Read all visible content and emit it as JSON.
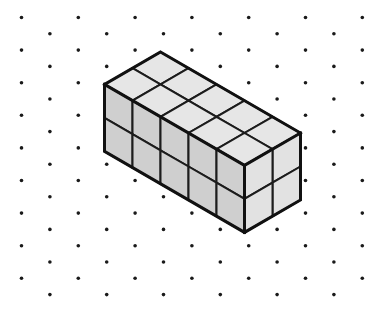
{
  "figure": {
    "type": "isometric-solid-on-dot-grid",
    "canvas": {
      "width": 373,
      "height": 313,
      "background": "#ffffff"
    }
  },
  "dot_grid": {
    "name": "isometric-dot-lattice",
    "pattern": "triangular",
    "dot_color": "#1a1a1a",
    "dot_radius": 1.8,
    "row_spacing_y": 16.3,
    "column_spacing_x": 56.8,
    "row_offset_x": 28.4,
    "origin_x": 21.5,
    "origin_y": 17.5,
    "rows": 18,
    "columns": 7
  },
  "solid": {
    "name": "cube-block",
    "description": "Rectangular prism built from unit cubes shown in isometric projection",
    "dimensions": {
      "length": 5,
      "depth": 2,
      "height": 2
    },
    "total_cubes": 20,
    "visible_faces": {
      "top": {
        "rows": 2,
        "columns": 5,
        "cells": 10
      },
      "left": {
        "rows": 2,
        "columns": 5,
        "cells": 10
      },
      "right": {
        "rows": 2,
        "columns": 2,
        "cells": 4
      }
    },
    "geometry": {
      "origin_x": 160.5,
      "origin_y": 52.0,
      "unit_x": 28.0,
      "unit_y": 16.2,
      "unit_z": 33.5
    },
    "colors": {
      "top_face": "#e6e6e6",
      "left_face": "#cfcfcf",
      "right_face": "#e2e2e2",
      "edge": "#1c1c1c",
      "outline": "#111111"
    },
    "stroke": {
      "inner_edge_width": 2.0,
      "outline_width": 3.0
    }
  },
  "labels": {
    "figure_caption": "",
    "axis_labels": [],
    "annotations": []
  }
}
